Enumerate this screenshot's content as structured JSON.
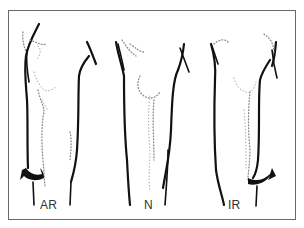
{
  "diagram": {
    "panels": [
      {
        "id": "ar",
        "label": "AR",
        "rotation_arrow": "left"
      },
      {
        "id": "n",
        "label": "N",
        "rotation_arrow": "none"
      },
      {
        "id": "ir",
        "label": "IR",
        "rotation_arrow": "right"
      }
    ],
    "colors": {
      "outline": "#111111",
      "stipple": "#8a8a8a",
      "frame": "#6a6a6a",
      "background": "#ffffff"
    }
  }
}
